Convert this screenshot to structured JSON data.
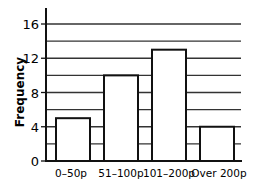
{
  "chart_data": {
    "type": "bar",
    "title": "",
    "xlabel": "",
    "ylabel": "Frequency",
    "categories": [
      "0–50p",
      "51–100p",
      "101–200p",
      "Over 200p"
    ],
    "values": [
      5,
      10,
      13,
      4
    ],
    "ylim": [
      0,
      17
    ],
    "yticks": [
      0,
      4,
      8,
      12,
      16
    ],
    "minor_gridlines": [
      2,
      6,
      10,
      14
    ],
    "grid": true,
    "legend": null,
    "colors": {
      "bar_fill": "#ffffff",
      "bar_stroke": "#111111",
      "grid": "#333333"
    }
  }
}
